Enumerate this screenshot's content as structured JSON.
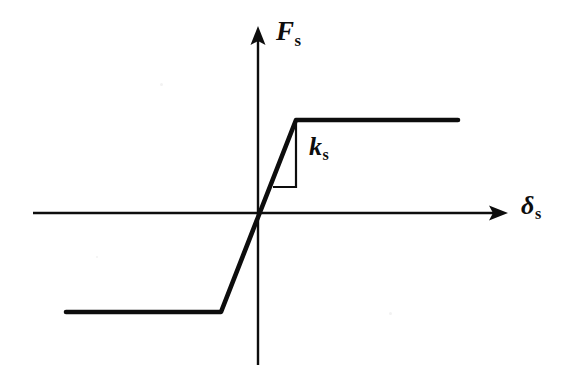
{
  "figure": {
    "background_color": "#ffffff",
    "ink_color": "#0d0d0d"
  },
  "labels": {
    "y_axis": {
      "symbol": "F",
      "subscript": "s",
      "text": "Fs"
    },
    "x_axis": {
      "symbol": "δ",
      "subscript": "s",
      "text": "δs"
    },
    "stiffness": {
      "symbol": "k",
      "subscript": "s",
      "text": "ks"
    }
  },
  "chart_data": {
    "type": "line",
    "title": "",
    "xlabel": "δs",
    "ylabel": "Fs",
    "grid": false,
    "legend": null,
    "axes": {
      "origin_px": [
        258,
        213
      ],
      "x_axis_px": {
        "x_start": 33,
        "x_end": 505,
        "y": 213,
        "arrow": "right"
      },
      "y_axis_px": {
        "y_start": 28,
        "y_end": 365,
        "x": 258,
        "arrow": "up"
      }
    },
    "series": [
      {
        "name": "Fs(δs)",
        "description": "Elastic-perfectly-plastic: constant negative force plateau, linear elastic branch of slope ks through the origin, constant positive force plateau",
        "points_px": [
          [
            66,
            312
          ],
          [
            221,
            312
          ],
          [
            296,
            120
          ],
          [
            458,
            120
          ]
        ],
        "points_normalized": [
          [
            -1.7,
            -1.0
          ],
          [
            -0.4,
            -1.0
          ],
          [
            0.4,
            1.0
          ],
          [
            1.75,
            1.0
          ]
        ]
      }
    ],
    "annotations": [
      {
        "name": "slope-triangle",
        "label": "ks",
        "meaning": "spring stiffness = rise / run of the elastic branch",
        "vertical_leg_px": {
          "x": 296,
          "y_top": 122,
          "y_bottom": 187
        },
        "horizontal_leg_px": {
          "y": 187,
          "x_left": 273,
          "x_right": 296
        }
      }
    ]
  }
}
